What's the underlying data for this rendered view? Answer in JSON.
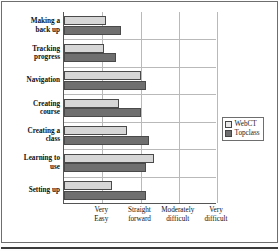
{
  "chart_data": {
    "type": "bar",
    "orientation": "horizontal",
    "title": "",
    "xlabel": "",
    "ylabel": "",
    "grid": "vertical-and-horizontal",
    "legend_position": "right",
    "xlim": [
      0,
      4
    ],
    "categories": [
      "Making a back up",
      "Tracking progress",
      "Navigation",
      "Creating course",
      "Creating a class",
      "Learning to use",
      "Setting up"
    ],
    "xtick_values": [
      1,
      2,
      3,
      4
    ],
    "xtick_labels": [
      "Very Easy",
      "Straight forward",
      "Moderately difficult",
      "Very difficult"
    ],
    "series": [
      {
        "name": "WebCT",
        "color": "#d6d6d6",
        "values": [
          1.1,
          1.05,
          2.0,
          1.44,
          1.65,
          2.35,
          1.25
        ]
      },
      {
        "name": "Topclass",
        "color": "#6f6f6f",
        "values": [
          1.49,
          1.36,
          2.14,
          2.01,
          2.22,
          2.14,
          2.14
        ]
      }
    ]
  },
  "categories": [
    {
      "line1": "Making a",
      "line2": "back up"
    },
    {
      "line1": "Tracking",
      "line2": "progress"
    },
    {
      "line1": "Navigation",
      "line2": ""
    },
    {
      "line1": "Creating",
      "line2": "course"
    },
    {
      "line1": "Creating a",
      "line2": "class"
    },
    {
      "line1": "Learning to",
      "line2": "use"
    },
    {
      "line1": "Setting up",
      "line2": ""
    }
  ],
  "xticks": [
    {
      "line1": "Very",
      "line2": "Easy"
    },
    {
      "line1": "Straight",
      "line2": "forward"
    },
    {
      "line1": "Moderately",
      "line2": "difficult"
    },
    {
      "line1": "Very",
      "line2": "difficult"
    }
  ],
  "legend": {
    "items": [
      {
        "label": "WebCT"
      },
      {
        "label": "Topclass"
      }
    ]
  }
}
